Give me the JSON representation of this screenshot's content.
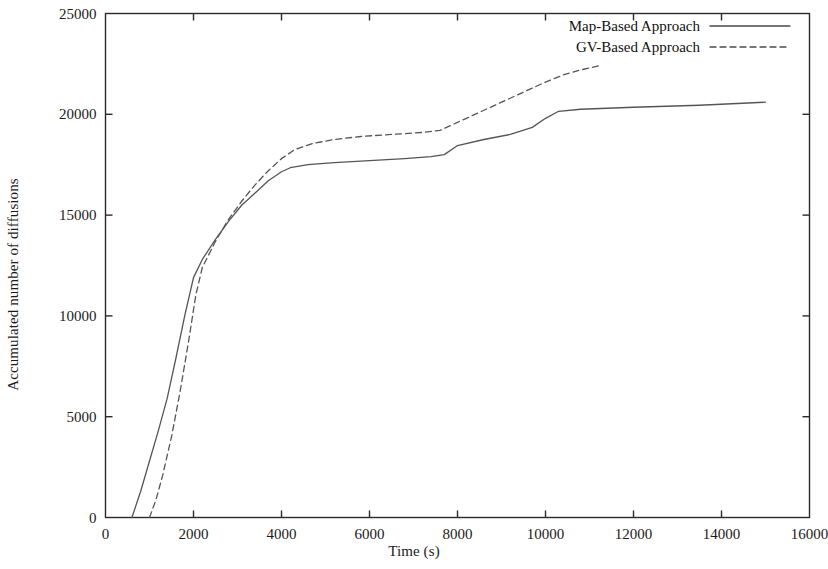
{
  "chart_data": {
    "type": "line",
    "title": "",
    "xlabel": "Time (s)",
    "ylabel": "Accumulated number of diffusions",
    "xlim": [
      0,
      16000
    ],
    "ylim": [
      0,
      25000
    ],
    "xticks": [
      0,
      2000,
      4000,
      6000,
      8000,
      10000,
      12000,
      14000,
      16000
    ],
    "xticklabels": [
      "0",
      "2000",
      "4000",
      "6000",
      "8000",
      "10000",
      "12000",
      "14000",
      "16000"
    ],
    "yticks": [
      0,
      5000,
      10000,
      15000,
      20000,
      25000
    ],
    "yticklabels": [
      "0",
      "5000",
      "10000",
      "15000",
      "20000",
      "25000"
    ],
    "grid": false,
    "legend_position": "top-right",
    "series": [
      {
        "name": "Map-Based Approach",
        "style": "solid",
        "color": "#555555",
        "points": [
          [
            600,
            0
          ],
          [
            800,
            1300
          ],
          [
            1000,
            2800
          ],
          [
            1200,
            4300
          ],
          [
            1400,
            5900
          ],
          [
            1600,
            7900
          ],
          [
            1800,
            10000
          ],
          [
            2000,
            11900
          ],
          [
            2200,
            12800
          ],
          [
            2500,
            13800
          ],
          [
            2800,
            14700
          ],
          [
            3100,
            15500
          ],
          [
            3400,
            16100
          ],
          [
            3700,
            16700
          ],
          [
            4000,
            17150
          ],
          [
            4200,
            17350
          ],
          [
            4600,
            17500
          ],
          [
            5200,
            17600
          ],
          [
            6000,
            17700
          ],
          [
            6800,
            17800
          ],
          [
            7400,
            17900
          ],
          [
            7700,
            18000
          ],
          [
            8000,
            18450
          ],
          [
            8600,
            18750
          ],
          [
            9200,
            19000
          ],
          [
            9700,
            19350
          ],
          [
            10000,
            19800
          ],
          [
            10300,
            20150
          ],
          [
            10800,
            20250
          ],
          [
            12000,
            20350
          ],
          [
            13500,
            20450
          ],
          [
            15000,
            20600
          ]
        ]
      },
      {
        "name": "GV-Based Approach",
        "style": "dashed",
        "color": "#555555",
        "points": [
          [
            1000,
            0
          ],
          [
            1150,
            900
          ],
          [
            1300,
            2100
          ],
          [
            1500,
            4000
          ],
          [
            1700,
            6300
          ],
          [
            1900,
            8900
          ],
          [
            2050,
            11000
          ],
          [
            2200,
            12400
          ],
          [
            2500,
            13700
          ],
          [
            2800,
            14800
          ],
          [
            3100,
            15700
          ],
          [
            3400,
            16500
          ],
          [
            3700,
            17200
          ],
          [
            4000,
            17800
          ],
          [
            4300,
            18250
          ],
          [
            4700,
            18550
          ],
          [
            5200,
            18750
          ],
          [
            5800,
            18900
          ],
          [
            6500,
            19000
          ],
          [
            7200,
            19100
          ],
          [
            7600,
            19200
          ],
          [
            8000,
            19600
          ],
          [
            8500,
            20100
          ],
          [
            9000,
            20600
          ],
          [
            9500,
            21100
          ],
          [
            10000,
            21600
          ],
          [
            10400,
            21950
          ],
          [
            10800,
            22200
          ],
          [
            11200,
            22400
          ]
        ]
      }
    ]
  },
  "legend": {
    "items": [
      {
        "label": "Map-Based Approach",
        "style": "solid"
      },
      {
        "label": "GV-Based Approach",
        "style": "dashed"
      }
    ]
  }
}
